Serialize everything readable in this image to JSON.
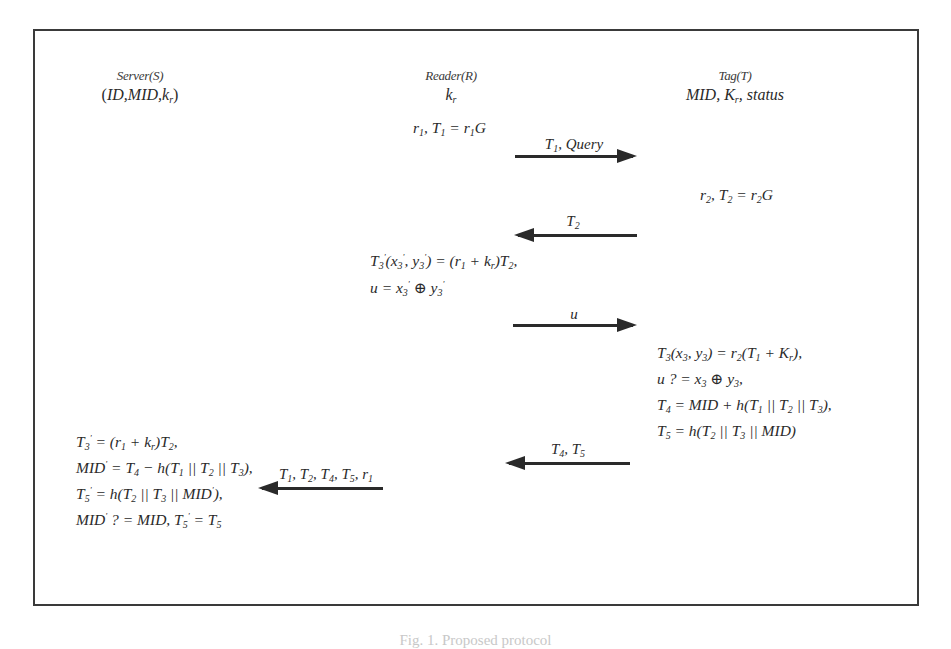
{
  "figure": {
    "parties": {
      "server": {
        "label": "Server(S)",
        "knowledge": "(ID, MID, k_r)"
      },
      "reader": {
        "label": "Reader(R)",
        "knowledge": "k_r"
      },
      "tag": {
        "label": "Tag(T)",
        "knowledge": "MID, K_r, status"
      }
    },
    "steps": {
      "reader_init": "r1, T1 = r1 G",
      "tag_init": "r2, T2 = r2 G",
      "reader_compute": [
        "T3'(x3', y3') = (r1 + k_r) T2,",
        "u = x3' ⊕ y3'"
      ],
      "tag_compute": [
        "T3(x3, y3) = r2(T1 + K_r),",
        "u ?= x3 ⊕ y3,",
        "T4 = MID + h(T1 || T2 || T3),",
        "T5 = h(T2 || T3 || MID)"
      ],
      "server_compute": [
        "T3' = (r1 + k_r) T2,",
        "MID' = T4 − h(T1 || T2 || T3),",
        "T5' = h(T2 || T3 || MID'),",
        "MID' ?= MID, T5' = T5"
      ]
    },
    "messages": [
      {
        "label": "T1, Query",
        "from": "reader",
        "to": "tag"
      },
      {
        "label": "T2",
        "from": "tag",
        "to": "reader"
      },
      {
        "label": "u",
        "from": "reader",
        "to": "tag"
      },
      {
        "label": "T4, T5",
        "from": "tag",
        "to": "reader"
      },
      {
        "label": "T1, T2, T4, T5, r1",
        "from": "reader",
        "to": "server"
      }
    ],
    "caption": "Fig. 1. ... protocol (clipped)"
  },
  "colors": {
    "ink": "#2a2a2a",
    "border": "#3a3a3a",
    "background": "#ffffff"
  }
}
